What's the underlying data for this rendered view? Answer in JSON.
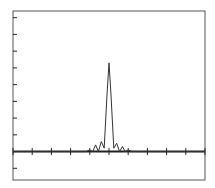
{
  "chart_data": {
    "type": "line",
    "title": "",
    "xlabel": "",
    "ylabel": "",
    "grid": false,
    "legend": null,
    "xlim": [
      -5,
      5
    ],
    "ylim": [
      -1.7,
      8.4
    ],
    "x_ticks": [
      -5,
      -4,
      -3,
      -2,
      -1,
      0,
      1,
      2,
      3,
      4,
      5
    ],
    "y_ticks": [
      -1,
      0,
      1,
      2,
      3,
      4,
      5,
      6,
      7,
      8
    ],
    "tick_labels_visible": false,
    "series": [
      {
        "name": "signal",
        "x": [
          -5,
          -1.2,
          -1.0,
          -0.85,
          -0.7,
          -0.55,
          -0.4,
          -0.25,
          -0.1,
          0.0,
          0.1,
          0.25,
          0.4,
          0.55,
          0.7,
          0.85,
          1.0,
          1.2,
          5
        ],
        "y": [
          0,
          0,
          0.1,
          0.0,
          0.4,
          0.0,
          0.6,
          0.2,
          3.5,
          5.3,
          3.5,
          0.2,
          0.5,
          0.0,
          0.3,
          0.0,
          0.1,
          0,
          0
        ]
      }
    ],
    "baseline": {
      "y": 0,
      "style": "thick"
    }
  },
  "colors": {
    "line": "#333333",
    "axis": "#222222",
    "frame": "#555555",
    "background": "#ffffff"
  }
}
